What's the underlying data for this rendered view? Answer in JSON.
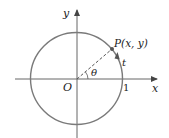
{
  "diagram": {
    "colors": {
      "circle": "#7a7a7a",
      "axes": "#666666",
      "radius_dash": "#555555",
      "point": "#555555",
      "text": "#222222",
      "background": "#ffffff"
    },
    "geometry": {
      "center": [
        76,
        79
      ],
      "radius": 46,
      "point_angle_deg": 43
    },
    "labels": {
      "y_axis": "y",
      "x_axis": "x",
      "origin": "O",
      "point": "P(x, y)",
      "point_prefix": "P",
      "point_coords": "(x, y)",
      "angle": "θ",
      "arc": "t",
      "one": "1"
    }
  }
}
